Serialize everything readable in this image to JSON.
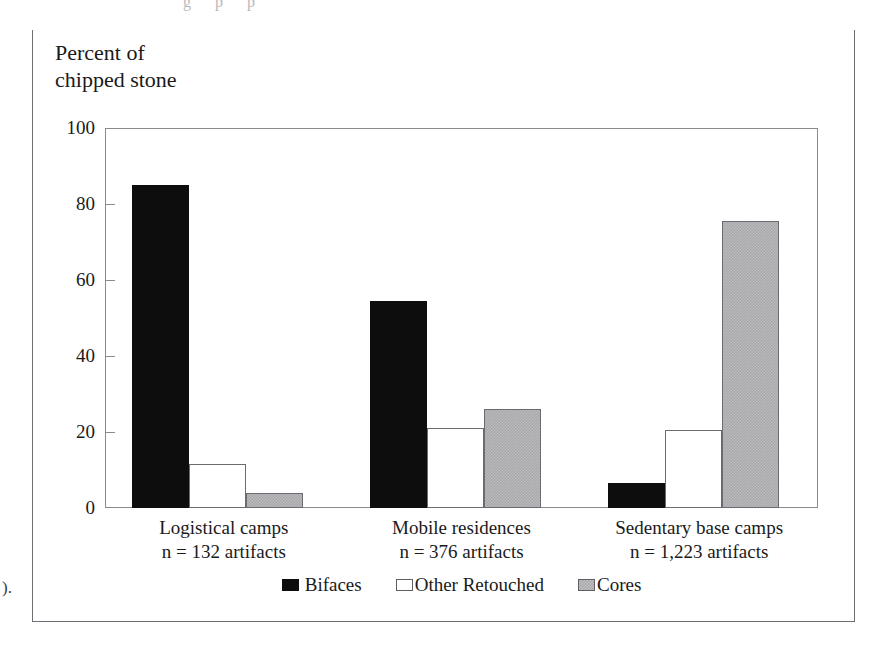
{
  "figure": {
    "top_fragment_text": "g  p   p",
    "margin_stray_text": ").",
    "axis_caption": "Percent of\nchipped stone"
  },
  "chart_data": {
    "type": "bar",
    "title": "",
    "subtitle": "",
    "xlabel": "",
    "ylabel": "Percent of chipped stone",
    "ylim": [
      0,
      100
    ],
    "yticks": [
      0,
      20,
      40,
      60,
      80,
      100
    ],
    "ytick_labels": [
      "0",
      "20",
      "40",
      "60",
      "80",
      "100"
    ],
    "grid": false,
    "legend_position": "bottom-center",
    "categories": [
      "Logistical camps\nn = 132 artifacts",
      "Mobile residences\nn = 376 artifacts",
      "Sedentary base camps\nn = 1,223 artifacts"
    ],
    "category_lines": [
      {
        "line1": "Logistical camps",
        "line2": "n = 132 artifacts"
      },
      {
        "line1": "Mobile residences",
        "line2": "n = 376 artifacts"
      },
      {
        "line1": "Sedentary base camps",
        "line2": "n = 1,223 artifacts"
      }
    ],
    "series": [
      {
        "name": "Bifaces",
        "color": "#0d0d0d",
        "values": [
          85,
          54.5,
          6.5
        ]
      },
      {
        "name": "Other Retouched",
        "color": "#ffffff",
        "values": [
          11.5,
          21,
          20.5
        ]
      },
      {
        "name": "Cores",
        "color": "#a9a9ab",
        "values": [
          4,
          26,
          75.5
        ]
      }
    ]
  },
  "legend": {
    "items": [
      {
        "label": "Bifaces",
        "swatch": "black-square-swatch"
      },
      {
        "label": "Other Retouched",
        "swatch": "white-square-swatch"
      },
      {
        "label": "Cores",
        "swatch": "gray-square-swatch"
      }
    ]
  }
}
